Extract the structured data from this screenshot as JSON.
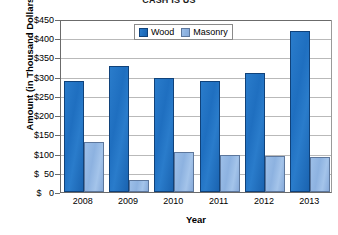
{
  "chart_data": {
    "type": "bar",
    "title": "CASH IS US",
    "xlabel": "Year",
    "ylabel": "Amount (in Thousand Dollars)",
    "categories": [
      "2008",
      "2009",
      "2010",
      "2011",
      "2012",
      "2013"
    ],
    "series": [
      {
        "name": "Wood",
        "color": "#1f6fc0",
        "values": [
          290,
          328,
          296,
          289,
          310,
          418
        ]
      },
      {
        "name": "Masonry",
        "color": "#8db2e0",
        "values": [
          130,
          32,
          105,
          95,
          94,
          91
        ]
      }
    ],
    "ylim": [
      0,
      450
    ],
    "ytick_step": 50,
    "ytick_labels": [
      "$450",
      "$400",
      "$350",
      "$300",
      "$250",
      "$200",
      "$150",
      "$100",
      "$  50",
      "$   0"
    ],
    "grid": true,
    "legend_position": "top-center"
  }
}
